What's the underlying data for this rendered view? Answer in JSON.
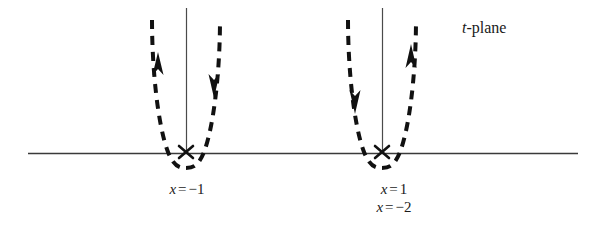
{
  "figure": {
    "title": "t-plane",
    "plane_label": {
      "symbol": "t",
      "separator": "-",
      "word": "plane"
    },
    "background_color": "#ffffff",
    "ink_color": "#111111",
    "axis_color": "#3a3a3a",
    "width": 599,
    "height": 237
  },
  "axes": {
    "horizontal": {
      "name": "real-axis",
      "x_start": 28,
      "x_end": 578,
      "y": 153
    },
    "vertical_lines": [
      {
        "name": "vertical-axis-left",
        "x": 186,
        "y_top": 8,
        "y_bottom": 153
      },
      {
        "name": "vertical-axis-right",
        "x": 382,
        "y_top": 8,
        "y_bottom": 153
      }
    ]
  },
  "singularities": [
    {
      "name": "branch-point-left",
      "marker": "x-cross",
      "x": 186,
      "y": 153,
      "labels": [
        "x = -1"
      ]
    },
    {
      "name": "branch-point-right",
      "marker": "x-cross",
      "x": 382,
      "y": 153,
      "labels": [
        "x = 1",
        "x = -2"
      ]
    }
  ],
  "labels": {
    "left": {
      "line1": {
        "var": "x",
        "op": "=",
        "value": "−1"
      }
    },
    "right": {
      "line1": {
        "var": "x",
        "op": "=",
        "value": "1"
      },
      "line2": {
        "var": "x",
        "op": "=",
        "value": "−2"
      }
    }
  },
  "contours": [
    {
      "name": "contour-left",
      "style": "dashed",
      "dash_pattern": "9 7",
      "stroke_width": 4,
      "vertex_x": 186,
      "vertex_y": 167,
      "top_y": 20,
      "arrows": [
        {
          "name": "arrow-left-branch-up",
          "branch": "left",
          "direction": "up",
          "x": 159,
          "y": 66
        },
        {
          "name": "arrow-right-branch-down",
          "branch": "right",
          "direction": "down",
          "x": 213,
          "y": 80
        }
      ]
    },
    {
      "name": "contour-right",
      "style": "dashed",
      "dash_pattern": "9 7",
      "stroke_width": 4,
      "vertex_x": 382,
      "vertex_y": 167,
      "top_y": 20,
      "arrows": [
        {
          "name": "arrow-left-branch-down",
          "branch": "left",
          "direction": "down",
          "x": 353,
          "y": 96
        },
        {
          "name": "arrow-right-branch-up",
          "branch": "right",
          "direction": "up",
          "x": 411,
          "y": 60
        }
      ]
    }
  ]
}
